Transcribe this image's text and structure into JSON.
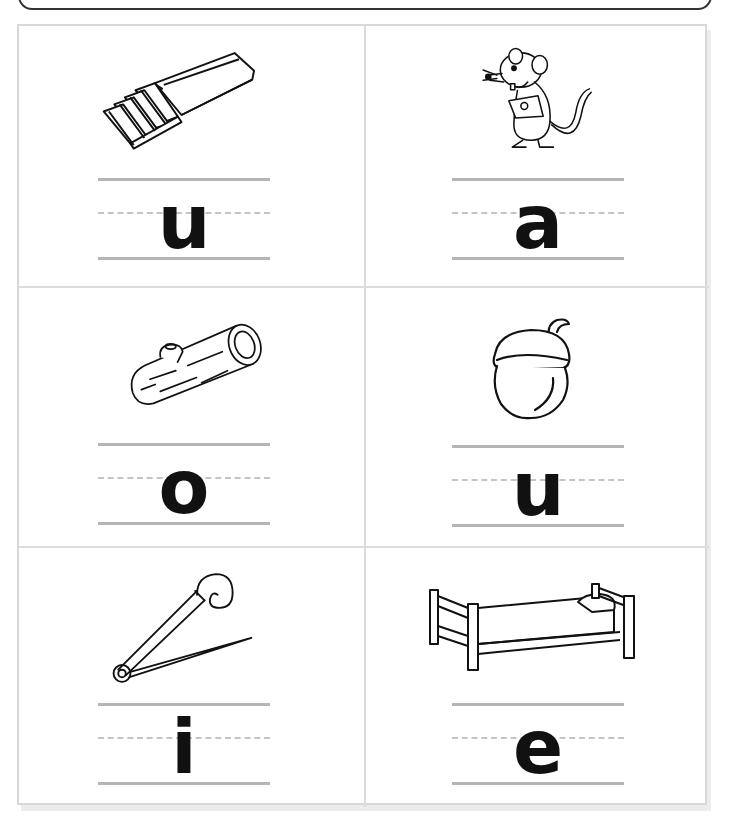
{
  "worksheet": {
    "instruction_box": "",
    "cells": [
      {
        "picture": "chewing-gum",
        "letter": "u"
      },
      {
        "picture": "rat",
        "letter": "a"
      },
      {
        "picture": "log",
        "letter": "o"
      },
      {
        "picture": "acorn",
        "letter": "u"
      },
      {
        "picture": "safety-pin",
        "letter": "i"
      },
      {
        "picture": "bed",
        "letter": "e"
      }
    ]
  },
  "colors": {
    "grid_border": "#d8d8d8",
    "writing_line": "#b5b5b5",
    "dashed_line": "#c4c4c4",
    "letter": "#111111"
  }
}
